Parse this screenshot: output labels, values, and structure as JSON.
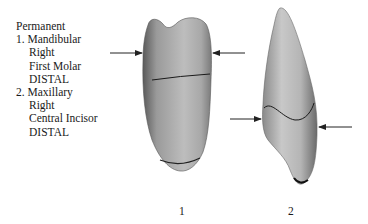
{
  "legend": {
    "heading": "Permanent",
    "items": [
      {
        "number": "1. Mandibular",
        "lines": [
          "Right",
          "First Molar",
          "DISTAL"
        ]
      },
      {
        "number": "2. Maxillary",
        "lines": [
          "Right",
          "Central Incisor",
          "DISTAL"
        ]
      }
    ]
  },
  "figures": [
    {
      "label": "1",
      "name": "mandibular-right-first-molar-distal"
    },
    {
      "label": "2",
      "name": "maxillary-right-central-incisor-distal"
    }
  ]
}
